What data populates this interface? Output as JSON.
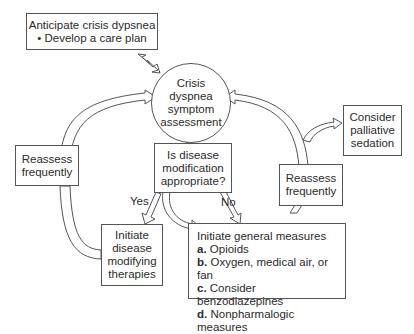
{
  "nodes": {
    "anticipate": {
      "title": "Anticipate crisis dypsnea",
      "bullet": "• Develop a care plan"
    },
    "assessment": {
      "lines": [
        "Crisis",
        "dyspnea",
        "symptom",
        "assessment"
      ]
    },
    "decision": {
      "lines": [
        "Is disease",
        "modification",
        "appropriate?"
      ]
    },
    "reassess_left": {
      "lines": [
        "Reassess",
        "frequently"
      ]
    },
    "reassess_right": {
      "lines": [
        "Reassess",
        "frequently"
      ]
    },
    "palliative": {
      "lines": [
        "Consider",
        "palliative",
        "sedation"
      ]
    },
    "disease_therapies": {
      "lines": [
        "Initiate",
        "disease",
        "modifying",
        "therapies"
      ]
    },
    "general_measures": {
      "title": "Initiate general measures",
      "items": [
        {
          "letter": "a.",
          "text": "Opioids"
        },
        {
          "letter": "b.",
          "text": "Oxygen, medical air, or fan"
        },
        {
          "letter": "c.",
          "text": "Consider benzodiazepines"
        },
        {
          "letter": "d.",
          "text": "Nonpharmalogic measures"
        }
      ]
    }
  },
  "edge_labels": {
    "yes": "Yes",
    "no": "No"
  }
}
